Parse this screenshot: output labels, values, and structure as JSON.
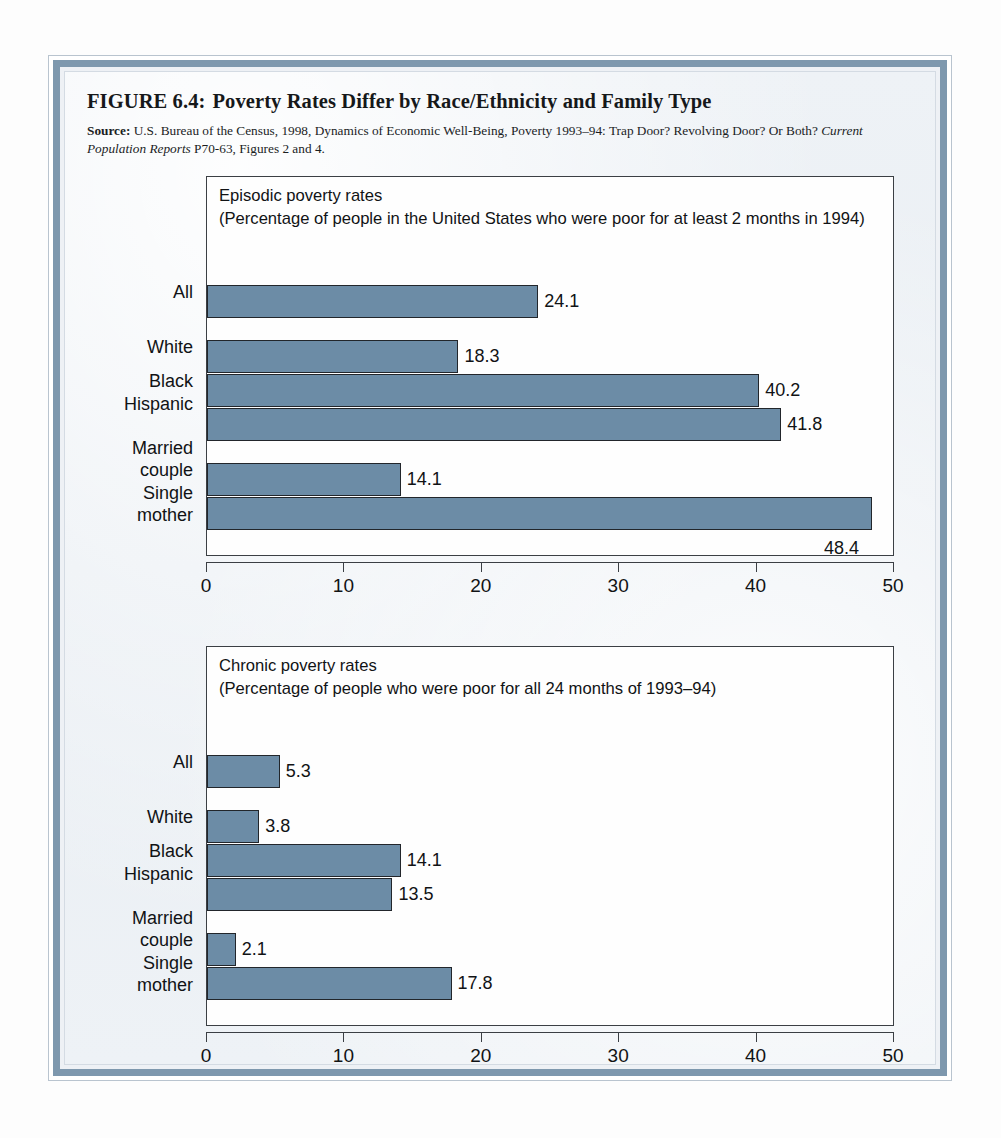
{
  "figure": {
    "label": "FIGURE 6.4:",
    "title": "Poverty Rates Differ by Race/Ethnicity and Family Type",
    "source_label": "Source:",
    "source_text_1": "U.S. Bureau of the Census, 1998, Dynamics of Economic Well-Being, Poverty 1993–94: Trap Door? Revolving Door? Or Both? ",
    "source_italic": "Current Population Reports",
    "source_text_2": " P70-63, Figures 2 and 4."
  },
  "chart_data": [
    {
      "type": "bar",
      "orientation": "horizontal",
      "title": "Episodic poverty rates",
      "subtitle": "(Percentage of people in the United States who were poor for at least 2 months in 1994)",
      "xlabel": "",
      "ylabel": "",
      "xlim": [
        0,
        50
      ],
      "xticks": [
        "0",
        "10",
        "20",
        "30",
        "40",
        "50"
      ],
      "grid": false,
      "legend": "none",
      "bar_color": "#6c8ca6",
      "categories": [
        "All",
        "White",
        "Black",
        "Hispanic",
        "Married\ncouple",
        "Single\nmother"
      ],
      "values": [
        24.1,
        18.3,
        40.2,
        41.8,
        14.1,
        48.4
      ],
      "value_labels": [
        "24.1",
        "18.3",
        "40.2",
        "41.8",
        "14.1",
        "48.4"
      ]
    },
    {
      "type": "bar",
      "orientation": "horizontal",
      "title": "Chronic poverty rates",
      "subtitle": "(Percentage of people who were poor for all 24 months of 1993–94)",
      "xlabel": "",
      "ylabel": "",
      "xlim": [
        0,
        50
      ],
      "xticks": [
        "0",
        "10",
        "20",
        "30",
        "40",
        "50"
      ],
      "grid": false,
      "legend": "none",
      "bar_color": "#6c8ca6",
      "categories": [
        "All",
        "White",
        "Black",
        "Hispanic",
        "Married\ncouple",
        "Single\nmother"
      ],
      "values": [
        5.3,
        3.8,
        14.1,
        13.5,
        2.1,
        17.8
      ],
      "value_labels": [
        "5.3",
        "3.8",
        "14.1",
        "13.5",
        "2.1",
        "17.8"
      ]
    }
  ]
}
